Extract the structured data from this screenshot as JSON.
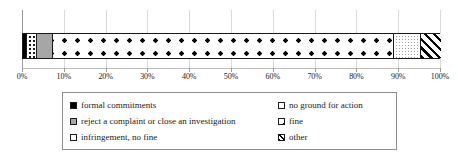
{
  "chart_data": {
    "type": "bar",
    "orientation": "horizontal",
    "stacked": true,
    "normalized_percent": true,
    "title": "",
    "xlabel": "",
    "ylabel": "",
    "xlim": [
      0,
      100
    ],
    "grid": true,
    "legend_position": "bottom",
    "categories": [
      ""
    ],
    "axis_ticks": [
      {
        "value": 0,
        "label": "0%"
      },
      {
        "value": 10,
        "label": "10%"
      },
      {
        "value": 20,
        "label": "20%"
      },
      {
        "value": 30,
        "label": "30%"
      },
      {
        "value": 40,
        "label": "40%"
      },
      {
        "value": 50,
        "label": "50%"
      },
      {
        "value": 60,
        "label": "60%"
      },
      {
        "value": 70,
        "label": "70%"
      },
      {
        "value": 80,
        "label": "80%"
      },
      {
        "value": 90,
        "label": "90%"
      },
      {
        "value": 100,
        "label": "100%"
      }
    ],
    "series": [
      {
        "name": "formal commitments",
        "pattern": "solid-black",
        "color": "#000000",
        "start": 0.0,
        "end": 0.6,
        "values": [
          0.6
        ]
      },
      {
        "name": "infringement, no fine",
        "pattern": "white-sparse-dots",
        "color": "#ffffff",
        "start": 0.6,
        "end": 3.0,
        "values": [
          2.4
        ]
      },
      {
        "name": "reject a complaint or close an investigation",
        "pattern": "grey-fill",
        "color": "#a6a6a6",
        "start": 3.0,
        "end": 6.9,
        "values": [
          3.9
        ]
      },
      {
        "name": "fine",
        "pattern": "large-black-dots",
        "color": "#ffffff",
        "start": 6.9,
        "end": 88.5,
        "values": [
          81.6
        ]
      },
      {
        "name": "no ground for action",
        "pattern": "light-stipple",
        "color": "#ffffff",
        "start": 88.5,
        "end": 94.9,
        "values": [
          6.4
        ]
      },
      {
        "name": "other",
        "pattern": "diagonal-hatch",
        "color": "#ffffff",
        "start": 94.9,
        "end": 100.0,
        "values": [
          5.1
        ]
      }
    ]
  },
  "legend": {
    "left_column": [
      {
        "label": "formal commitments",
        "swatch": "solid-black-swatch"
      },
      {
        "label": "reject a complaint or close an investigation",
        "swatch": "grey-swatch"
      },
      {
        "label": "infringement, no fine",
        "swatch": "white-sparse-dots-swatch"
      }
    ],
    "right_column": [
      {
        "label": "no ground for action",
        "swatch": "light-stipple-swatch"
      },
      {
        "label": "fine",
        "swatch": "large-black-dots-swatch"
      },
      {
        "label": "other",
        "swatch": "diagonal-hatch-swatch"
      }
    ]
  },
  "colors": {
    "black": "#000000",
    "grey": "#a6a6a6",
    "white": "#ffffff",
    "gridline": "#d9d9d9",
    "axis": "#9a9a9a",
    "legend_border": "#8c8c8c"
  }
}
